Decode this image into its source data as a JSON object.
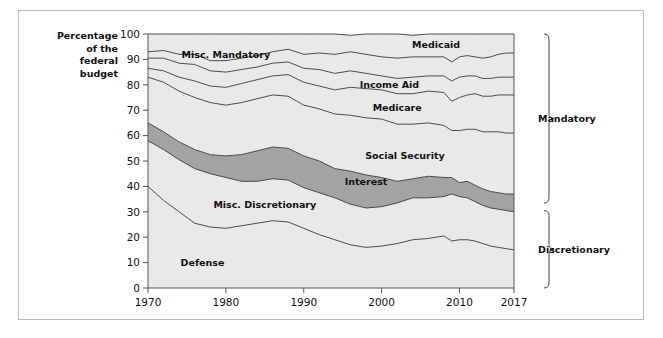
{
  "chart_data": {
    "type": "area",
    "title": "",
    "subtitle": "",
    "xlabel": "",
    "ylabel": "Percentage of the federal budget",
    "ylabel_lines": [
      "Percentage",
      "of the",
      "federal",
      "budget"
    ],
    "xlim": [
      1970,
      2017
    ],
    "ylim": [
      0,
      100
    ],
    "grid": false,
    "legend_position": "inline-labels",
    "stacked": true,
    "stack_order_bottom_to_top": [
      "Defense",
      "Misc. Discretionary",
      "Interest",
      "Social Security",
      "Medicare",
      "Income Aid",
      "Medicaid",
      "Misc. Mandatory"
    ],
    "yticks": [
      0,
      10,
      20,
      30,
      40,
      50,
      60,
      70,
      80,
      90,
      100
    ],
    "ytick_labels": [
      "0",
      "10",
      "20",
      "30",
      "40",
      "50",
      "60",
      "70",
      "80",
      "90",
      "100"
    ],
    "xticks": [
      1970,
      1980,
      1990,
      2000,
      2010,
      2017
    ],
    "xtick_labels": [
      "1970",
      "1980",
      "1990",
      "2000",
      "2010",
      "2017"
    ],
    "x": [
      1970,
      1972,
      1974,
      1976,
      1978,
      1980,
      1982,
      1984,
      1986,
      1988,
      1990,
      1992,
      1994,
      1996,
      1998,
      2000,
      2002,
      2004,
      2006,
      2008,
      2009,
      2010,
      2011,
      2012,
      2013,
      2014,
      2015,
      2016,
      2017
    ],
    "series": [
      {
        "name": "Defense",
        "color": "#e9e9e9",
        "label_x": 1977,
        "label_y": 10,
        "values": [
          40.0,
          34.5,
          30.0,
          25.5,
          24.0,
          23.5,
          24.5,
          25.5,
          26.5,
          26.0,
          23.5,
          21.0,
          19.0,
          17.0,
          16.0,
          16.5,
          17.5,
          19.0,
          19.5,
          20.5,
          18.5,
          19.0,
          19.0,
          18.5,
          17.5,
          16.5,
          16.0,
          15.5,
          15.0
        ]
      },
      {
        "name": "Misc. Discretionary",
        "color": "#e9e9e9",
        "label_x": 1985,
        "label_y": 33,
        "values": [
          18.0,
          20.0,
          20.5,
          21.5,
          21.0,
          20.0,
          17.5,
          16.5,
          16.5,
          16.5,
          16.0,
          16.5,
          16.5,
          16.0,
          15.5,
          15.5,
          16.0,
          16.5,
          16.0,
          15.5,
          18.5,
          17.0,
          16.5,
          15.5,
          15.0,
          15.0,
          15.0,
          15.0,
          15.0
        ]
      },
      {
        "name": "Interest",
        "color": "#a3a3a3",
        "label_x": 1998,
        "label_y": 42,
        "values": [
          7.0,
          7.0,
          7.0,
          7.5,
          7.5,
          8.5,
          10.5,
          12.0,
          12.5,
          12.5,
          12.5,
          12.5,
          11.5,
          13.0,
          13.0,
          11.5,
          8.5,
          7.5,
          8.5,
          7.5,
          6.5,
          5.5,
          6.5,
          6.5,
          6.5,
          6.5,
          6.5,
          6.5,
          7.0
        ]
      },
      {
        "name": "Social Security",
        "color": "#e9e9e9",
        "label_x": 2003,
        "label_y": 52,
        "values": [
          18.0,
          19.5,
          20.0,
          20.5,
          20.5,
          20.0,
          20.5,
          20.5,
          20.5,
          20.5,
          20.0,
          20.5,
          21.5,
          22.0,
          22.5,
          23.0,
          22.5,
          21.5,
          21.0,
          20.5,
          18.5,
          20.5,
          20.5,
          22.0,
          22.5,
          23.5,
          24.0,
          24.0,
          24.0
        ]
      },
      {
        "name": "Medicare",
        "color": "#e9e9e9",
        "label_x": 2002,
        "label_y": 71,
        "values": [
          3.5,
          4.5,
          5.5,
          6.5,
          6.5,
          7.0,
          7.5,
          7.5,
          7.5,
          8.5,
          9.0,
          9.0,
          9.5,
          11.0,
          11.5,
          11.5,
          12.0,
          12.0,
          12.5,
          13.0,
          11.5,
          13.0,
          13.5,
          14.0,
          14.0,
          14.0,
          14.5,
          15.0,
          15.0
        ]
      },
      {
        "name": "Income Aid",
        "color": "#e9e9e9",
        "label_x": 2001,
        "label_y": 80,
        "values": [
          4.0,
          5.0,
          5.5,
          6.5,
          6.0,
          6.0,
          5.5,
          5.0,
          5.0,
          5.0,
          5.5,
          6.5,
          6.5,
          6.5,
          6.0,
          5.5,
          6.0,
          6.5,
          6.0,
          6.5,
          8.0,
          8.0,
          7.5,
          7.0,
          7.0,
          7.0,
          7.0,
          7.0,
          7.0
        ]
      },
      {
        "name": "Medicaid",
        "color": "#e9e9e9",
        "label_x": 2007,
        "label_y": 96,
        "values": [
          2.5,
          3.0,
          3.5,
          4.0,
          4.0,
          4.5,
          4.5,
          4.5,
          4.5,
          5.0,
          5.5,
          6.5,
          7.5,
          7.5,
          7.5,
          7.5,
          8.0,
          8.0,
          7.5,
          7.5,
          7.5,
          8.0,
          8.0,
          7.5,
          8.0,
          8.5,
          9.0,
          9.5,
          9.5
        ]
      },
      {
        "name": "Misc. Mandatory",
        "color": "#e9e9e9",
        "label_x": 1980,
        "label_y": 92,
        "values": [
          7.0,
          6.5,
          8.0,
          8.0,
          10.5,
          10.5,
          9.5,
          8.5,
          7.0,
          6.0,
          8.0,
          7.5,
          8.0,
          6.5,
          8.0,
          9.0,
          9.5,
          8.5,
          9.0,
          9.0,
          11.0,
          9.0,
          8.5,
          9.0,
          9.5,
          9.0,
          8.0,
          7.5,
          7.5
        ]
      }
    ],
    "annotations": [
      {
        "text": "Mandatory",
        "type": "bracket",
        "side": "right",
        "from_y": 33.5,
        "to_y": 100
      },
      {
        "text": "Discretionary",
        "type": "bracket",
        "side": "right",
        "from_y": 0,
        "to_y": 30.5
      }
    ]
  }
}
